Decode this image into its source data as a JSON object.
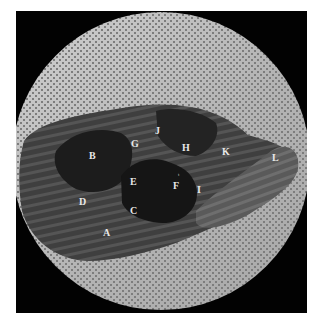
{
  "figure": {
    "type": "anatomical specimen photograph on perforated circular plate",
    "colors": {
      "background": "#ffffff",
      "frame": "#020202",
      "plate": "#b9b9b9",
      "plate_dots": "#7d7d7d",
      "specimen_dark": "#1a1a1a",
      "specimen_mid": "#4a4a4a",
      "label": "#e8e8e8"
    },
    "labels": [
      {
        "id": "A",
        "text": "A",
        "x": 103,
        "y": 228
      },
      {
        "id": "B",
        "text": "B",
        "x": 89,
        "y": 151
      },
      {
        "id": "C",
        "text": "C",
        "x": 130,
        "y": 206
      },
      {
        "id": "D",
        "text": "D",
        "x": 79,
        "y": 197
      },
      {
        "id": "E",
        "text": "E",
        "x": 130,
        "y": 177
      },
      {
        "id": "F",
        "text": "F",
        "x": 173,
        "y": 181
      },
      {
        "id": "G",
        "text": "G",
        "x": 131,
        "y": 139
      },
      {
        "id": "H",
        "text": "H",
        "x": 182,
        "y": 143
      },
      {
        "id": "I",
        "text": "I",
        "x": 197,
        "y": 185
      },
      {
        "id": "J",
        "text": "J",
        "x": 155,
        "y": 126
      },
      {
        "id": "K",
        "text": "K",
        "x": 222,
        "y": 147
      },
      {
        "id": "L",
        "text": "L",
        "x": 272,
        "y": 153
      }
    ],
    "small_mark": {
      "text": "t",
      "x": 178,
      "y": 172
    }
  }
}
